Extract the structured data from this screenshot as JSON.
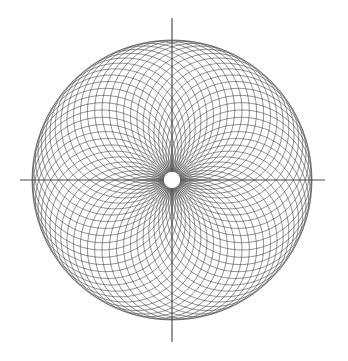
{
  "figure": {
    "canvas": {
      "width": 348,
      "height": 361,
      "background_color": "#ffffff"
    },
    "line_color": "#3a3a3a",
    "axis_color": "#4a4a4a",
    "hole_color": "#ffffff",
    "center": {
      "x": 172,
      "y": 180
    },
    "outer_radius": 140,
    "center_hole_radius": 8.2
  },
  "chart_data": {
    "type": "line",
    "subtitle": "",
    "xlabel": "",
    "ylabel": "",
    "grid": false,
    "legend_position": "none",
    "xlim": [
      -140,
      140
    ],
    "ylim": [
      -140,
      140
    ],
    "construction": {
      "curve_kind": "circle-rosette",
      "circle_count": 60,
      "circle_radius": 70,
      "center_orbit_radius": 70,
      "start_angle_deg": 0,
      "angle_step_deg": 6,
      "envelope_radius": 140,
      "samples_per_circle": 240
    },
    "axes_overlay": {
      "vertical": {
        "x": 172,
        "y_top": 18,
        "y_bottom": 342
      },
      "horizontal": {
        "y": 180,
        "x_left": 20,
        "x_right": 325
      }
    },
    "series": [
      {
        "name": "circle-rosette",
        "values": [
          140,
          140,
          140,
          140,
          140,
          140,
          140,
          140,
          140,
          140,
          140,
          140
        ]
      }
    ],
    "categories": [
      "0",
      "30",
      "60",
      "90",
      "120",
      "150",
      "180",
      "210",
      "240",
      "270",
      "300",
      "330"
    ]
  }
}
